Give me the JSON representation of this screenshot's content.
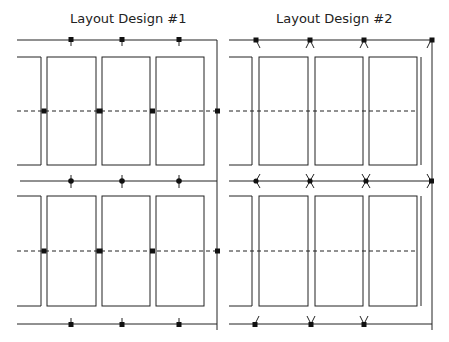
{
  "layouts": [
    {
      "title": "Layout Design #1",
      "variant": "numbered-1",
      "connector_style": "square-dot-with-stem",
      "rows": 2,
      "columns_per_row": 3
    },
    {
      "title": "Layout Design #2",
      "variant": "numbered-2",
      "connector_style": "dot-with-angled-branches",
      "rows": 2,
      "columns_per_row": 3
    }
  ],
  "colors": {
    "stroke": "#222222",
    "background": "#ffffff"
  }
}
